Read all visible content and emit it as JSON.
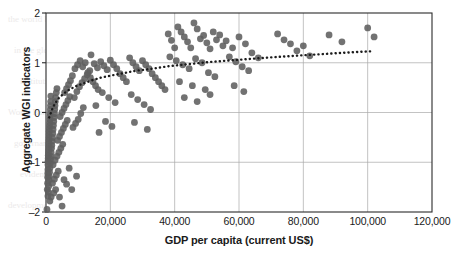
{
  "chart_data": {
    "type": "scatter",
    "title": "",
    "xlabel": "GDP per capita (current US$)",
    "ylabel": "Aggregate WGI indicators",
    "xlim": [
      0,
      120000
    ],
    "ylim": [
      -2,
      2
    ],
    "xticks": [
      0,
      20000,
      40000,
      60000,
      80000,
      100000,
      120000
    ],
    "xtick_labels": [
      "0",
      "20,000",
      "40,000",
      "60,000",
      "80,000",
      "100,000",
      "120,000"
    ],
    "yticks": [
      -2,
      -1,
      0,
      1,
      2
    ],
    "ytick_labels": [
      "-2",
      "-1",
      "0",
      "1",
      "2"
    ],
    "grid": true,
    "legend": false,
    "marker_color": "#5e5e5e",
    "marker_size": 3.4,
    "trendline": {
      "style": "dotted",
      "color": "#1c1c1c",
      "label": "",
      "points": [
        [
          1000,
          -0.1
        ],
        [
          2000,
          0.08
        ],
        [
          3000,
          0.2
        ],
        [
          4000,
          0.29
        ],
        [
          5500,
          0.38
        ],
        [
          7000,
          0.45
        ],
        [
          9000,
          0.52
        ],
        [
          11000,
          0.57
        ],
        [
          14000,
          0.64
        ],
        [
          17000,
          0.7
        ],
        [
          20000,
          0.74
        ],
        [
          24000,
          0.79
        ],
        [
          28000,
          0.84
        ],
        [
          33000,
          0.88
        ],
        [
          38000,
          0.93
        ],
        [
          44000,
          0.97
        ],
        [
          50000,
          1.01
        ],
        [
          58000,
          1.05
        ],
        [
          66000,
          1.09
        ],
        [
          75000,
          1.13
        ],
        [
          85000,
          1.17
        ],
        [
          95000,
          1.21
        ],
        [
          101000,
          1.23
        ]
      ]
    },
    "series": [
      {
        "name": "Countries",
        "points": [
          [
            300,
            -1.95
          ],
          [
            400,
            -1.55
          ],
          [
            500,
            -1.42
          ],
          [
            520,
            -1.3
          ],
          [
            560,
            -1.22
          ],
          [
            600,
            -1.15
          ],
          [
            620,
            -1.05
          ],
          [
            650,
            -0.98
          ],
          [
            700,
            -0.92
          ],
          [
            720,
            -0.86
          ],
          [
            760,
            -0.8
          ],
          [
            800,
            -0.74
          ],
          [
            830,
            -0.68
          ],
          [
            860,
            -0.62
          ],
          [
            900,
            -0.56
          ],
          [
            950,
            -0.5
          ],
          [
            980,
            -0.44
          ],
          [
            1000,
            -0.38
          ],
          [
            1050,
            -0.32
          ],
          [
            1100,
            -0.26
          ],
          [
            1150,
            -0.2
          ],
          [
            1200,
            -0.14
          ],
          [
            1250,
            -0.08
          ],
          [
            1300,
            -0.02
          ],
          [
            1350,
            0.06
          ],
          [
            1400,
            0.14
          ],
          [
            1450,
            0.22
          ],
          [
            1500,
            0.33
          ],
          [
            600,
            -1.68
          ],
          [
            700,
            -1.6
          ],
          [
            820,
            -1.48
          ],
          [
            900,
            -1.36
          ],
          [
            1000,
            -1.28
          ],
          [
            1100,
            -1.2
          ],
          [
            1200,
            -1.12
          ],
          [
            1300,
            -1.02
          ],
          [
            1400,
            -0.94
          ],
          [
            1500,
            -0.88
          ],
          [
            1600,
            -0.8
          ],
          [
            1700,
            -0.72
          ],
          [
            1800,
            -0.66
          ],
          [
            1900,
            -0.58
          ],
          [
            2000,
            -0.5
          ],
          [
            2100,
            -0.42
          ],
          [
            2200,
            -0.34
          ],
          [
            2300,
            -0.26
          ],
          [
            2400,
            -0.18
          ],
          [
            2500,
            -0.1
          ],
          [
            2600,
            -0.02
          ],
          [
            2700,
            0.06
          ],
          [
            2800,
            0.14
          ],
          [
            2900,
            0.22
          ],
          [
            3000,
            0.3
          ],
          [
            3200,
            0.4
          ],
          [
            3400,
            0.48
          ],
          [
            1200,
            -1.78
          ],
          [
            1600,
            -1.7
          ],
          [
            2400,
            -1.62
          ],
          [
            3000,
            -1.55
          ],
          [
            2000,
            -1.42
          ],
          [
            2600,
            -1.34
          ],
          [
            3200,
            -1.26
          ],
          [
            3800,
            -1.18
          ],
          [
            2200,
            -1.05
          ],
          [
            2800,
            -0.96
          ],
          [
            3400,
            -0.88
          ],
          [
            4000,
            -0.8
          ],
          [
            4600,
            -0.72
          ],
          [
            5200,
            -0.64
          ],
          [
            3600,
            -0.56
          ],
          [
            4200,
            -0.48
          ],
          [
            4800,
            -0.4
          ],
          [
            5400,
            -0.32
          ],
          [
            6000,
            -0.24
          ],
          [
            6600,
            -0.16
          ],
          [
            4400,
            -0.08
          ],
          [
            5000,
            0.0
          ],
          [
            5600,
            0.08
          ],
          [
            6200,
            0.16
          ],
          [
            6800,
            0.24
          ],
          [
            7400,
            0.32
          ],
          [
            5800,
            0.4
          ],
          [
            6400,
            0.48
          ],
          [
            7000,
            0.56
          ],
          [
            7600,
            0.64
          ],
          [
            5000,
            -1.88
          ],
          [
            8000,
            -1.55
          ],
          [
            4200,
            -1.7
          ],
          [
            6400,
            -1.44
          ],
          [
            9500,
            -1.28
          ],
          [
            7200,
            -1.12
          ],
          [
            5600,
            -1.35
          ],
          [
            8400,
            -0.3
          ],
          [
            9200,
            -0.22
          ],
          [
            10000,
            -0.14
          ],
          [
            10800,
            -0.02
          ],
          [
            11600,
            0.1
          ],
          [
            8800,
            0.3
          ],
          [
            9600,
            0.42
          ],
          [
            10400,
            0.52
          ],
          [
            11200,
            0.6
          ],
          [
            12000,
            0.68
          ],
          [
            12800,
            0.76
          ],
          [
            13600,
            0.84
          ],
          [
            8200,
            0.74
          ],
          [
            9000,
            0.88
          ],
          [
            9800,
            0.96
          ],
          [
            10600,
            1.04
          ],
          [
            11400,
            0.92
          ],
          [
            12200,
            1.0
          ],
          [
            13000,
            0.8
          ],
          [
            13800,
            0.7
          ],
          [
            14600,
            0.62
          ],
          [
            15400,
            0.54
          ],
          [
            16200,
            0.46
          ],
          [
            14000,
            1.16
          ],
          [
            15000,
            0.98
          ],
          [
            16000,
            0.9
          ],
          [
            17000,
            1.02
          ],
          [
            18000,
            0.94
          ],
          [
            19000,
            0.86
          ],
          [
            20000,
            1.05
          ],
          [
            21000,
            0.96
          ],
          [
            22000,
            0.88
          ],
          [
            23000,
            0.78
          ],
          [
            24000,
            0.7
          ],
          [
            25000,
            0.62
          ],
          [
            17500,
            0.4
          ],
          [
            19500,
            0.3
          ],
          [
            21500,
            0.2
          ],
          [
            15500,
            0.14
          ],
          [
            18500,
            -0.18
          ],
          [
            20500,
            -0.28
          ],
          [
            16500,
            -0.4
          ],
          [
            26000,
            1.1
          ],
          [
            27000,
            1.0
          ],
          [
            28000,
            0.92
          ],
          [
            29000,
            0.84
          ],
          [
            30000,
            1.04
          ],
          [
            31000,
            0.96
          ],
          [
            32000,
            0.88
          ],
          [
            33000,
            0.78
          ],
          [
            34000,
            0.7
          ],
          [
            35000,
            0.62
          ],
          [
            36000,
            0.54
          ],
          [
            37000,
            0.46
          ],
          [
            26500,
            0.36
          ],
          [
            28500,
            0.26
          ],
          [
            30500,
            0.16
          ],
          [
            32500,
            0.06
          ],
          [
            27500,
            -0.2
          ],
          [
            31500,
            -0.34
          ],
          [
            38000,
            1.58
          ],
          [
            39000,
            1.45
          ],
          [
            40000,
            1.3
          ],
          [
            41000,
            1.72
          ],
          [
            42000,
            1.62
          ],
          [
            43000,
            1.52
          ],
          [
            44000,
            1.42
          ],
          [
            45000,
            1.3
          ],
          [
            46000,
            1.8
          ],
          [
            47000,
            1.68
          ],
          [
            48000,
            1.48
          ],
          [
            49000,
            1.55
          ],
          [
            50000,
            1.4
          ],
          [
            51000,
            1.28
          ],
          [
            52000,
            1.62
          ],
          [
            53000,
            1.46
          ],
          [
            54000,
            1.56
          ],
          [
            55000,
            1.34
          ],
          [
            38500,
            1.12
          ],
          [
            40500,
            1.04
          ],
          [
            42500,
            0.96
          ],
          [
            44500,
            0.88
          ],
          [
            46500,
            1.08
          ],
          [
            48500,
            1.0
          ],
          [
            50500,
            0.8
          ],
          [
            52500,
            0.72
          ],
          [
            41500,
            0.62
          ],
          [
            45500,
            0.54
          ],
          [
            49500,
            0.46
          ],
          [
            43000,
            0.3
          ],
          [
            47000,
            0.22
          ],
          [
            51000,
            0.36
          ],
          [
            56000,
            1.44
          ],
          [
            58000,
            1.3
          ],
          [
            60000,
            1.52
          ],
          [
            62000,
            1.38
          ],
          [
            57000,
            1.12
          ],
          [
            59000,
            1.02
          ],
          [
            61000,
            0.92
          ],
          [
            63000,
            0.84
          ],
          [
            64000,
            1.2
          ],
          [
            66000,
            1.1
          ],
          [
            58500,
            0.54
          ],
          [
            61500,
            0.42
          ],
          [
            72000,
            1.58
          ],
          [
            74000,
            1.46
          ],
          [
            76000,
            1.38
          ],
          [
            78000,
            1.24
          ],
          [
            80000,
            1.34
          ],
          [
            82000,
            1.14
          ],
          [
            88000,
            1.56
          ],
          [
            92000,
            1.42
          ],
          [
            100000,
            1.7
          ],
          [
            102000,
            1.52
          ]
        ]
      }
    ]
  },
  "ghost_text": [
    "the world bank report on development",
    "in the global economy and the role of",
    "institutional quality across regions",
    "World Bank Group   World Bank Group",
    "governance indicators and growth",
    "evidence from cross country data",
    "development policy review series"
  ]
}
